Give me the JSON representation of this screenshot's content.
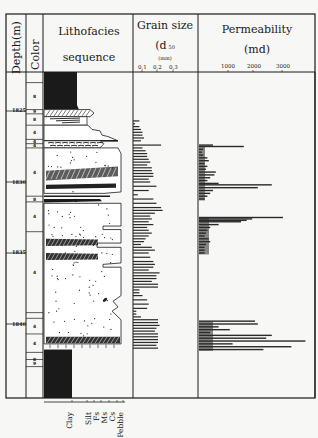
{
  "chart_data": {
    "type": "bar",
    "title": "",
    "layout": "vertical well-log with horizontal bars",
    "columns": [
      {
        "key": "depth",
        "label": "Depth(m)"
      },
      {
        "key": "color",
        "label": "Color"
      },
      {
        "key": "lithofacies",
        "label": "Lithofacies sequence"
      },
      {
        "key": "grain_size",
        "label": "Grain size",
        "sublabel": "(d 50",
        "unit": "(mm)"
      },
      {
        "key": "permeability",
        "label": "Permeability",
        "unit": "(md)"
      }
    ],
    "depth_axis": {
      "ticks": [
        1825,
        1830,
        1835,
        1840
      ],
      "range": [
        1823,
        1843
      ]
    },
    "color_codes": [
      {
        "top": 1823.0,
        "bottom": 1824.9,
        "code": "8"
      },
      {
        "top": 1824.9,
        "bottom": 1825.2,
        "code": "9"
      },
      {
        "top": 1825.2,
        "bottom": 1826.0,
        "code": "8"
      },
      {
        "top": 1826.0,
        "bottom": 1827.0,
        "code": "4"
      },
      {
        "top": 1827.0,
        "bottom": 1827.3,
        "code": "4"
      },
      {
        "top": 1827.3,
        "bottom": 1827.6,
        "code": "4"
      },
      {
        "top": 1827.6,
        "bottom": 1831.0,
        "code": "4"
      },
      {
        "top": 1831.0,
        "bottom": 1831.4,
        "code": "8"
      },
      {
        "top": 1831.4,
        "bottom": 1833.5,
        "code": "4"
      },
      {
        "top": 1833.5,
        "bottom": 1839.2,
        "code": "4"
      },
      {
        "top": 1839.2,
        "bottom": 1839.6,
        "code": ""
      },
      {
        "top": 1839.6,
        "bottom": 1840.7,
        "code": "4"
      },
      {
        "top": 1840.7,
        "bottom": 1842.0,
        "code": "4"
      },
      {
        "top": 1842.0,
        "bottom": 1843.0,
        "code": "8"
      },
      {
        "top": 1842.5,
        "bottom": 1843.0,
        "code": "9"
      }
    ],
    "grain_size_scale": {
      "ticks": [
        0.1,
        0.2,
        0.3
      ],
      "tick_labels": [
        "0,1",
        "0,2",
        "0,3"
      ],
      "class_labels": [
        "Clay",
        "Silt",
        "Fs",
        "Ms",
        "Cs",
        "Pebble"
      ]
    },
    "grain_size": {
      "unit": "mm",
      "depths": [
        1825.7,
        1825.9,
        1826.1,
        1826.3,
        1826.5,
        1826.7,
        1826.9,
        1827.1,
        1827.4,
        1827.6,
        1827.8,
        1828.0,
        1828.2,
        1828.4,
        1828.6,
        1828.8,
        1829.0,
        1829.2,
        1829.4,
        1829.6,
        1829.8,
        1830.0,
        1830.3,
        1830.6,
        1830.9,
        1831.2,
        1831.5,
        1831.8,
        1832.0,
        1832.2,
        1832.4,
        1832.6,
        1832.8,
        1833.0,
        1833.2,
        1833.4,
        1833.6,
        1833.8,
        1834.0,
        1834.2,
        1834.4,
        1834.6,
        1834.8,
        1835.0,
        1835.3,
        1835.6,
        1835.8,
        1836.0,
        1836.2,
        1836.4,
        1836.6,
        1836.8,
        1837.0,
        1837.2,
        1837.4,
        1837.6,
        1837.8,
        1838.0,
        1838.3,
        1838.6,
        1838.9,
        1839.1,
        1839.3,
        1839.5,
        1839.7,
        1839.9,
        1840.1,
        1840.3,
        1840.5,
        1840.7,
        1840.9,
        1841.1,
        1841.3,
        1841.5,
        1841.7
      ],
      "values": [
        0.08,
        0.05,
        0.08,
        0.09,
        0.1,
        0.1,
        0.11,
        0.09,
        0.22,
        0.1,
        0.12,
        0.13,
        0.13,
        0.14,
        0.15,
        0.13,
        0.16,
        0.16,
        0.17,
        0.17,
        0.14,
        0.15,
        0.19,
        0.14,
        0.07,
        0.17,
        0.19,
        0.22,
        0.23,
        0.18,
        0.15,
        0.16,
        0.14,
        0.17,
        0.13,
        0.14,
        0.16,
        0.14,
        0.12,
        0.11,
        0.09,
        0.16,
        0.18,
        0.14,
        0.15,
        0.17,
        0.18,
        0.17,
        0.14,
        0.21,
        0.19,
        0.19,
        0.16,
        0.2,
        0.2,
        0.08,
        0.08,
        0.1,
        0.13,
        0.14,
        0.13,
        0.06,
        0.06,
        0.09,
        0.2,
        0.2,
        0.21,
        0.19,
        0.18,
        0.2,
        0.2,
        0.2,
        0.2,
        0.19,
        0.2
      ]
    },
    "permeability_scale": {
      "ticks": [
        1000,
        2000,
        3000
      ],
      "range": [
        0,
        4000
      ]
    },
    "permeability": {
      "unit": "md",
      "depths": [
        1827.4,
        1827.5,
        1827.7,
        1827.9,
        1828.1,
        1828.3,
        1828.5,
        1828.7,
        1828.9,
        1829.1,
        1829.3,
        1829.5,
        1829.7,
        1829.9,
        1830.1,
        1830.2,
        1830.4,
        1830.6,
        1830.8,
        1831.0,
        1831.2,
        1832.5,
        1832.6,
        1832.7,
        1832.8,
        1833.0,
        1833.2,
        1833.4,
        1833.6,
        1833.8,
        1834.0,
        1834.2,
        1834.4,
        1834.6,
        1834.8,
        1835.0,
        1839.8,
        1840.0,
        1840.2,
        1840.4,
        1840.6,
        1840.8,
        1841.0,
        1841.2,
        1841.4,
        1841.6,
        1841.8
      ],
      "values": [
        500,
        1600,
        150,
        100,
        150,
        300,
        350,
        200,
        300,
        250,
        600,
        550,
        400,
        300,
        700,
        2600,
        2100,
        500,
        400,
        300,
        200,
        3000,
        1900,
        1700,
        1500,
        700,
        400,
        300,
        250,
        200,
        350,
        400,
        250,
        200,
        200,
        200,
        2000,
        2100,
        700,
        1100,
        400,
        2600,
        2400,
        3800,
        1200,
        3300,
        2300
      ]
    }
  },
  "header": {
    "depth": "Depth(m)",
    "color": "Color",
    "litho_line1": "Lithofacies",
    "litho_line2": "sequence",
    "gs_line1": "Grain  size",
    "gs_line2": "(d",
    "gs_sub": "50",
    "gs_unit": "(mm)",
    "gs_ticks": [
      "0,1",
      "0,2",
      "0,3"
    ],
    "perm_line1": "Permeability",
    "perm_line2": "(md)",
    "perm_ticks": [
      "1000",
      "2000",
      "3000"
    ]
  },
  "depth_labels": [
    "1825",
    "1830",
    "1835",
    "1840"
  ],
  "grain_classes": [
    "Clay",
    "Silt",
    "Fs",
    "Ms",
    "Cs",
    "Pebble"
  ]
}
